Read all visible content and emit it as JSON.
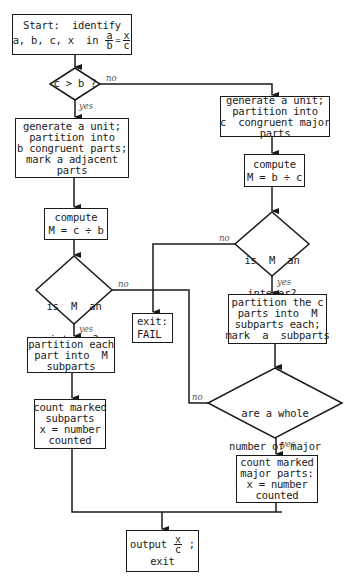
{
  "flowchart": {
    "start": {
      "line1": "Start:  identify",
      "line2": "a, b, c, x  in ",
      "fraction_left": {
        "num": "a",
        "den": "b"
      },
      "equals": "=",
      "fraction_right": {
        "num": "x",
        "den": "c"
      }
    },
    "decision_c_gt_b": {
      "text": "c > b ?",
      "yes_label": "yes",
      "no_label": "no"
    },
    "left_branch": {
      "generate": [
        "generate a unit;",
        "partition into",
        "b congruent parts;",
        "mark a adjacent",
        "parts"
      ],
      "compute": {
        "line1": "compute",
        "line2": "M = c ÷ b"
      },
      "decision_integer": {
        "lines": [
          "is  M  an",
          "integer?"
        ],
        "yes_label": "yes",
        "no_label": "no"
      },
      "partition": [
        "partition each",
        "part into  M",
        "subparts"
      ],
      "count": [
        "count marked",
        "subparts",
        "x = number",
        "counted"
      ]
    },
    "right_branch": {
      "generate": [
        "generate a unit;",
        "partition into",
        "c  congruent major",
        "parts"
      ],
      "compute": {
        "line1": "compute",
        "line2": "M = b ÷ c"
      },
      "decision_integer": {
        "lines": [
          "is  M  an",
          "integer?"
        ],
        "yes_label": "yes",
        "no_label": "no"
      },
      "partition": [
        "partition the c",
        "parts into  M",
        "subparts each;",
        "mark  a  subparts"
      ],
      "decision_whole": {
        "lines": [
          "are a whole",
          "number of major",
          "parts marked?"
        ],
        "yes_label": "yes",
        "no_label": "no"
      },
      "count": [
        "count marked",
        "major parts:",
        "x = number",
        "counted"
      ]
    },
    "fail": {
      "line1": "exit:",
      "line2": "FAIL"
    },
    "output": {
      "prefix": "output ",
      "fraction": {
        "num": "x",
        "den": "c"
      },
      "suffix": " ;",
      "line2": "exit"
    }
  }
}
